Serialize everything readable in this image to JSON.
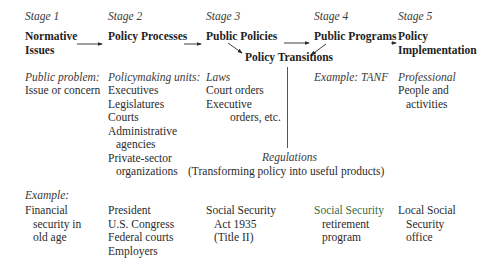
{
  "stages": [
    {
      "label": "Stage 1",
      "title_lines": [
        "Normative",
        "Issues"
      ]
    },
    {
      "label": "Stage 2",
      "title_lines": [
        "Policy Processes"
      ]
    },
    {
      "label": "Stage 3",
      "title_lines": [
        "Public Policies"
      ]
    },
    {
      "label": "Stage 4",
      "title_lines": [
        "Public Programs"
      ]
    },
    {
      "label": "Stage 5",
      "title_lines": [
        "Policy",
        "Implementation"
      ]
    }
  ],
  "transition": {
    "title": "Policy Transitions"
  },
  "details": {
    "stage1": {
      "heading": "Public problem:",
      "lines": [
        "Issue or concern"
      ]
    },
    "stage2": {
      "heading": "Policymaking units:",
      "lines": [
        "Executives",
        "Legislatures",
        "Courts",
        "Administrative",
        "agencies",
        "Private-sector",
        "organizations"
      ]
    },
    "stage3": {
      "heading": "Laws",
      "lines": [
        "Court orders",
        "Executive",
        "orders, etc."
      ]
    },
    "stage4": {
      "heading": "Example: TANF",
      "lines": []
    },
    "stage5": {
      "heading": "Professional",
      "lines": [
        "People and",
        "activities"
      ]
    }
  },
  "regulations": {
    "title": "Regulations",
    "subtitle": "(Transforming policy into useful products)"
  },
  "example": {
    "heading": "Example:",
    "stage1": [
      "Financial",
      "security in",
      "old age"
    ],
    "stage2": [
      "President",
      "U.S. Congress",
      "Federal courts",
      "Employers"
    ],
    "stage3": [
      "Social Security",
      "Act 1935",
      "(Title II)"
    ],
    "stage4": [
      "Social Security",
      "retirement",
      "program"
    ],
    "stage5": [
      "Local Social",
      "Security",
      "office"
    ]
  }
}
